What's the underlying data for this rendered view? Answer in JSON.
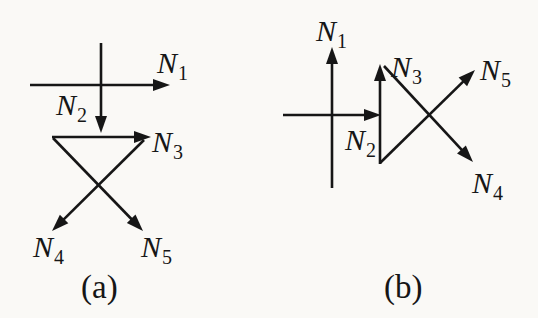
{
  "figure": {
    "background_color": "#faf9f6",
    "ink_color": "#161616",
    "stroke_width": 2.6,
    "arrowhead": {
      "length": 17,
      "half_width": 6
    },
    "panels": [
      {
        "id": "a",
        "caption": "(a)",
        "labels": [
          {
            "name": "n1",
            "base": "N",
            "sub": "1",
            "x": 157,
            "y": 48
          },
          {
            "name": "n2",
            "base": "N",
            "sub": "2",
            "x": 56,
            "y": 90
          },
          {
            "name": "n3",
            "base": "N",
            "sub": "3",
            "x": 152,
            "y": 127
          },
          {
            "name": "n4",
            "base": "N",
            "sub": "4",
            "x": 33,
            "y": 232
          },
          {
            "name": "n5",
            "base": "N",
            "sub": "5",
            "x": 141,
            "y": 232
          }
        ],
        "arrows": [
          {
            "name": "n1",
            "x1": 30,
            "y1": 85,
            "x2": 170,
            "y2": 85
          },
          {
            "name": "n2",
            "x1": 101,
            "y1": 43,
            "x2": 101,
            "y2": 133
          },
          {
            "name": "n3",
            "x1": 52,
            "y1": 137,
            "x2": 151,
            "y2": 137
          },
          {
            "name": "n4",
            "x1": 144,
            "y1": 140,
            "x2": 52,
            "y2": 231
          },
          {
            "name": "n5",
            "x1": 53,
            "y1": 138,
            "x2": 143,
            "y2": 231
          }
        ]
      },
      {
        "id": "b",
        "caption": "(b)",
        "labels": [
          {
            "name": "n1",
            "base": "N",
            "sub": "1",
            "x": 316,
            "y": 16
          },
          {
            "name": "n2",
            "base": "N",
            "sub": "2",
            "x": 345,
            "y": 125
          },
          {
            "name": "n3",
            "base": "N",
            "sub": "3",
            "x": 391,
            "y": 52
          },
          {
            "name": "n4",
            "base": "N",
            "sub": "4",
            "x": 472,
            "y": 168
          },
          {
            "name": "n5",
            "base": "N",
            "sub": "5",
            "x": 480,
            "y": 55
          }
        ],
        "arrows": [
          {
            "name": "n1",
            "x1": 332,
            "y1": 188,
            "x2": 332,
            "y2": 47
          },
          {
            "name": "n2",
            "x1": 283,
            "y1": 115,
            "x2": 381,
            "y2": 115
          },
          {
            "name": "n3",
            "x1": 380,
            "y1": 164,
            "x2": 380,
            "y2": 64
          },
          {
            "name": "n4",
            "x1": 384,
            "y1": 66,
            "x2": 473,
            "y2": 162
          },
          {
            "name": "n5",
            "x1": 380,
            "y1": 163,
            "x2": 475,
            "y2": 70
          }
        ]
      }
    ]
  }
}
